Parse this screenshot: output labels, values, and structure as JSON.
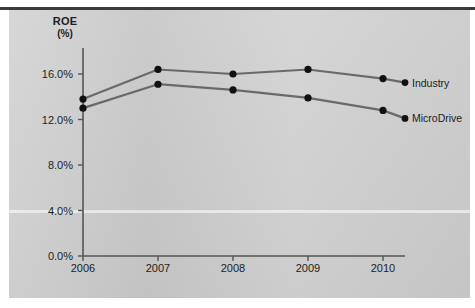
{
  "figure": {
    "background_color": "#cfcfcf",
    "page_color": "#ffffff",
    "rule_color": "#3a3a3a"
  },
  "axis_title": {
    "line1": "ROE",
    "line2": "(%)"
  },
  "chart_data": {
    "type": "line",
    "title": "ROE (%)",
    "xlabel": "",
    "ylabel": "ROE (%)",
    "categories": [
      "2006",
      "2007",
      "2008",
      "2009",
      "2010"
    ],
    "x": [
      2006,
      2007,
      2008,
      2009,
      2010
    ],
    "ylim": [
      0.0,
      18.0
    ],
    "yticks": [
      0.0,
      4.0,
      8.0,
      12.0,
      16.0
    ],
    "ytick_labels": [
      "0.0%",
      "4.0%",
      "8.0%",
      "12.0%",
      "16.0%"
    ],
    "xtick_labels": [
      "2006",
      "2007",
      "2008",
      "2009",
      "2010"
    ],
    "grid": false,
    "legend_position": "right-inline",
    "marker": "filled-circle",
    "series": [
      {
        "name": "Industry",
        "color": "#6a6a6a",
        "values": [
          13.8,
          16.4,
          16.0,
          16.4,
          15.6
        ]
      },
      {
        "name": "MicroDrive",
        "color": "#6a6a6a",
        "values": [
          13.0,
          15.1,
          14.6,
          13.9,
          12.8
        ]
      }
    ]
  },
  "legend": [
    {
      "label": "Industry"
    },
    {
      "label": "MicroDrive"
    }
  ]
}
